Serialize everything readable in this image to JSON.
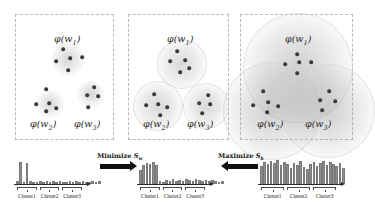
{
  "figure": {
    "panels": [
      {
        "id": "initial",
        "labels": [
          {
            "name": "phi-w1",
            "text": "φ(w",
            "sub": "1",
            "close": ")",
            "x": 38,
            "y": 18
          },
          {
            "name": "phi-w2",
            "text": "φ(w",
            "sub": "2",
            "close": ")",
            "x": 14,
            "y": 103
          },
          {
            "name": "phi-w3",
            "text": "φ(w",
            "sub": "3",
            "close": ")",
            "x": 58,
            "y": 103
          }
        ],
        "halos": [
          {
            "x": 52,
            "y": 44,
            "r": 17,
            "kind": "small"
          },
          {
            "x": 34,
            "y": 89,
            "r": 14,
            "kind": "small"
          },
          {
            "x": 75,
            "y": 79,
            "r": 14,
            "kind": "small"
          }
        ],
        "dots": [
          {
            "x": 47,
            "y": 34
          },
          {
            "x": 40,
            "y": 46
          },
          {
            "x": 54,
            "y": 43
          },
          {
            "x": 66,
            "y": 42
          },
          {
            "x": 52,
            "y": 55
          },
          {
            "x": 30,
            "y": 74
          },
          {
            "x": 20,
            "y": 89
          },
          {
            "x": 33,
            "y": 88
          },
          {
            "x": 30,
            "y": 96
          },
          {
            "x": 40,
            "y": 93
          },
          {
            "x": 78,
            "y": 72
          },
          {
            "x": 71,
            "y": 80
          },
          {
            "x": 82,
            "y": 81
          },
          {
            "x": 72,
            "y": 92
          }
        ]
      },
      {
        "id": "within-scatter-minimized",
        "labels": [
          {
            "name": "phi-w1",
            "text": "φ(w",
            "sub": "1",
            "close": ")",
            "x": 38,
            "y": 18
          },
          {
            "name": "phi-w2",
            "text": "φ(w",
            "sub": "2",
            "close": ")",
            "x": 14,
            "y": 103
          },
          {
            "name": "phi-w3",
            "text": "φ(w",
            "sub": "3",
            "close": ")",
            "x": 58,
            "y": 103
          }
        ],
        "halos": [
          {
            "x": 52,
            "y": 48,
            "r": 24,
            "kind": "mid"
          },
          {
            "x": 28,
            "y": 90,
            "r": 24,
            "kind": "mid"
          },
          {
            "x": 76,
            "y": 90,
            "r": 22,
            "kind": "mid"
          }
        ],
        "dots": [
          {
            "x": 48,
            "y": 36
          },
          {
            "x": 41,
            "y": 46
          },
          {
            "x": 56,
            "y": 45
          },
          {
            "x": 51,
            "y": 57
          },
          {
            "x": 60,
            "y": 53
          },
          {
            "x": 25,
            "y": 79
          },
          {
            "x": 17,
            "y": 90
          },
          {
            "x": 29,
            "y": 89
          },
          {
            "x": 38,
            "y": 92
          },
          {
            "x": 31,
            "y": 100
          },
          {
            "x": 79,
            "y": 80
          },
          {
            "x": 70,
            "y": 88
          },
          {
            "x": 81,
            "y": 89
          },
          {
            "x": 73,
            "y": 98
          }
        ]
      },
      {
        "id": "between-scatter-maximized",
        "labels": [
          {
            "name": "phi-w1",
            "text": "φ(w",
            "sub": "1",
            "close": ")",
            "x": 44,
            "y": 18
          },
          {
            "name": "phi-w2",
            "text": "φ(w",
            "sub": "2",
            "close": ")",
            "x": 16,
            "y": 103
          },
          {
            "name": "phi-w3",
            "text": "φ(w",
            "sub": "3",
            "close": ")",
            "x": 64,
            "y": 103
          }
        ],
        "halos": [
          {
            "x": 56,
            "y": 52,
            "r": 54,
            "kind": "big"
          },
          {
            "x": 30,
            "y": 95,
            "r": 48,
            "kind": "big"
          },
          {
            "x": 86,
            "y": 95,
            "r": 46,
            "kind": "big"
          }
        ],
        "dots": [
          {
            "x": 56,
            "y": 39
          },
          {
            "x": 44,
            "y": 49
          },
          {
            "x": 58,
            "y": 47
          },
          {
            "x": 70,
            "y": 47
          },
          {
            "x": 56,
            "y": 58
          },
          {
            "x": 22,
            "y": 76
          },
          {
            "x": 12,
            "y": 90
          },
          {
            "x": 27,
            "y": 87
          },
          {
            "x": 37,
            "y": 91
          },
          {
            "x": 26,
            "y": 97
          },
          {
            "x": 88,
            "y": 76
          },
          {
            "x": 79,
            "y": 85
          },
          {
            "x": 94,
            "y": 86
          },
          {
            "x": 81,
            "y": 95
          }
        ]
      }
    ],
    "charts": [
      {
        "id": "chart-initial",
        "bars": [
          3,
          22,
          2,
          21,
          3,
          2,
          2,
          3,
          2,
          3,
          2,
          3,
          2,
          3,
          2,
          2,
          3,
          2,
          3,
          2,
          3,
          2,
          2,
          3,
          2,
          3
        ],
        "cluster_labels": [
          "Cluster1",
          "Cluster2",
          "Cluster3"
        ]
      },
      {
        "id": "chart-minimized",
        "bars": [
          14,
          19,
          21,
          20,
          22,
          19,
          3,
          2,
          4,
          3,
          5,
          3,
          4,
          3,
          5,
          4,
          3,
          5,
          4,
          3,
          4,
          3,
          4,
          3,
          2,
          3
        ],
        "cluster_labels": [
          "Cluster1",
          "Cluster2",
          "Cluster3"
        ]
      },
      {
        "id": "chart-maximized",
        "bars": [
          18,
          22,
          20,
          23,
          21,
          24,
          19,
          22,
          20,
          16,
          21,
          19,
          23,
          17,
          15,
          20,
          22,
          18,
          21,
          23,
          19,
          22,
          20,
          18,
          21,
          16
        ],
        "cluster_labels": [
          "Cluster1",
          "Cluster2",
          "Cluster3"
        ]
      }
    ],
    "arrows": [
      {
        "id": "arrow-minimize",
        "label": "Minimize ",
        "symbol": "S",
        "sub": "w",
        "direction": "right"
      },
      {
        "id": "arrow-maximize",
        "label": "Maximize ",
        "symbol": "S",
        "sub": "b",
        "direction": "left"
      }
    ]
  }
}
